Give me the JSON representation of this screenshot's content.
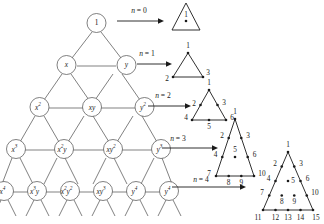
{
  "figure": {
    "background_color": "#ffffff",
    "line_color": "#1a1a1a",
    "lattice_line_color": "#4a4a4a"
  },
  "lattice": {
    "name": "monomial-lattice",
    "rows": [
      {
        "degree": 0,
        "labels": [
          {
            "base": "1",
            "sup": "",
            "italic": false
          }
        ]
      },
      {
        "degree": 1,
        "labels": [
          {
            "base": "x",
            "sup": "",
            "italic": true
          },
          {
            "base": "y",
            "sup": "",
            "italic": true
          }
        ]
      },
      {
        "degree": 2,
        "labels": [
          {
            "base": "x",
            "sup": "2",
            "italic": true
          },
          {
            "base": "xy",
            "sup": "",
            "italic": true
          },
          {
            "base": "y",
            "sup": "2",
            "italic": true
          }
        ]
      },
      {
        "degree": 3,
        "labels": [
          {
            "base": "x",
            "sup": "3",
            "italic": true
          },
          {
            "base": "x",
            "sup": "2",
            "italic": true,
            "tail": "y"
          },
          {
            "base": "xy",
            "sup": "2",
            "italic": true
          },
          {
            "base": "y",
            "sup": "3",
            "italic": true
          }
        ]
      },
      {
        "degree": 4,
        "labels": [
          {
            "base": "x",
            "sup": "4",
            "italic": true
          },
          {
            "base": "x",
            "sup": "3",
            "italic": true,
            "tail": "y"
          },
          {
            "base": "x",
            "sup": "2",
            "italic": true,
            "tail": "y",
            "tail_sup": "2"
          },
          {
            "base": "xy",
            "sup": "3",
            "italic": true
          },
          {
            "base": "y",
            "sup": "4",
            "italic": true
          }
        ]
      }
    ]
  },
  "arrows": [
    {
      "id": "arrow-n0",
      "label_var": "n",
      "label_eq": "= 0",
      "label_text": "n = 0"
    },
    {
      "id": "arrow-n1",
      "label_var": "n",
      "label_eq": "= 1",
      "label_text": "n = 1"
    },
    {
      "id": "arrow-n2",
      "label_var": "n",
      "label_eq": "= 2",
      "label_text": "n = 2"
    },
    {
      "id": "arrow-n3",
      "label_var": "n",
      "label_eq": "= 3",
      "label_text": "n = 3"
    },
    {
      "id": "arrow-n4",
      "label_var": "n",
      "label_eq": "= 4",
      "label_text": "n = 4"
    }
  ],
  "triangles": [
    {
      "id": "triangle-n0",
      "n": 0,
      "rows": 1,
      "point_count": 1,
      "numbers": [
        "1"
      ]
    },
    {
      "id": "triangle-n1",
      "n": 1,
      "rows": 2,
      "point_count": 3,
      "numbers": [
        "1",
        "2",
        "3"
      ]
    },
    {
      "id": "triangle-n2",
      "n": 2,
      "rows": 3,
      "point_count": 6,
      "numbers": [
        "1",
        "2",
        "3",
        "4",
        "5",
        "6"
      ]
    },
    {
      "id": "triangle-n3",
      "n": 3,
      "rows": 4,
      "point_count": 10,
      "numbers": [
        "1",
        "2",
        "3",
        "4",
        "5",
        "6",
        "7",
        "8",
        "9",
        "10"
      ]
    },
    {
      "id": "triangle-n4",
      "n": 4,
      "rows": 5,
      "point_count": 15,
      "numbers": [
        "1",
        "2",
        "3",
        "4",
        "5",
        "6",
        "7",
        "8",
        "9",
        "10",
        "11",
        "12",
        "13",
        "14",
        "15"
      ]
    }
  ],
  "chart_data": {
    "type": "diagram",
    "categories": [
      "n = 0",
      "n = 1",
      "n = 2",
      "n = 3",
      "n = 4"
    ],
    "values": [
      1,
      3,
      6,
      10,
      15
    ],
    "series": [
      {
        "name": "points per triangle (triangular numbers)",
        "values": [
          1,
          3,
          6,
          10,
          15
        ]
      },
      {
        "name": "monomials per lattice row",
        "values": [
          1,
          2,
          3,
          4,
          5
        ]
      }
    ],
    "xlabel": "n",
    "ylabel": "number of points",
    "legend": []
  }
}
